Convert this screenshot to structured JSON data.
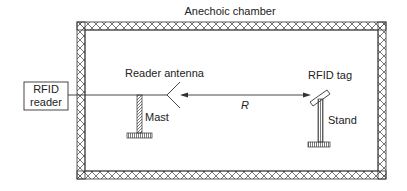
{
  "diagram": {
    "title": "Anechoic chamber",
    "reader_box": {
      "line1": "RFID",
      "line2": "reader"
    },
    "labels": {
      "reader_antenna": "Reader antenna",
      "mast": "Mast",
      "distance": "R",
      "rfid_tag": "RFID tag",
      "stand": "Stand"
    },
    "colors": {
      "line": "#333333",
      "wall_fill": "#ffffff",
      "hatch": "#555555"
    }
  }
}
